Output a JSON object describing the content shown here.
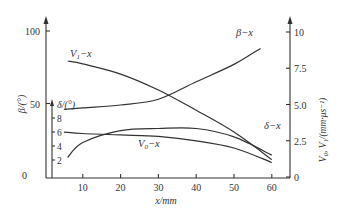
{
  "chart_data": {
    "type": "line",
    "title": "",
    "xlabel": "x/mm",
    "ylabel_left": "β/(°)",
    "ylabel_inner": "δ/(°)",
    "ylabel_right": "V0, V1/(mm·μs⁻¹)",
    "x_ticks": [
      "10",
      "20",
      "30",
      "40",
      "50",
      "60"
    ],
    "x_origin_label": "0",
    "left_ticks": [
      "100",
      "50"
    ],
    "left_origin_label": "0",
    "inner_ticks": [
      "8",
      "6",
      "4",
      "2"
    ],
    "right_ticks": [
      "10",
      "7.5",
      "5.0",
      "2.5",
      "0"
    ],
    "xlim": [
      0,
      65
    ],
    "ylim_left": [
      0,
      100
    ],
    "ylim_inner": [
      0,
      10
    ],
    "ylim_right": [
      0,
      10
    ],
    "grid": false,
    "legend": "inline labels",
    "series": [
      {
        "name": "β-x",
        "axis": "left",
        "label": "β−x",
        "x": [
          5,
          10,
          20,
          30,
          40,
          50,
          57
        ],
        "values": [
          46,
          47,
          49,
          53,
          65,
          77,
          88
        ]
      },
      {
        "name": "V1-x",
        "axis": "right",
        "label": "V₁−x",
        "x": [
          6,
          10,
          20,
          30,
          40,
          50,
          60
        ],
        "values": [
          8.0,
          7.8,
          7.1,
          6.0,
          4.6,
          3.1,
          1.2
        ]
      },
      {
        "name": "V0-x",
        "axis": "right",
        "label": "V₀−x",
        "x": [
          5,
          10,
          20,
          30,
          40,
          50,
          60
        ],
        "values": [
          3.1,
          3.0,
          2.9,
          2.8,
          2.5,
          2.0,
          1.0
        ]
      },
      {
        "name": "δ-x",
        "axis": "inner",
        "label": "δ−x",
        "x": [
          6,
          10,
          20,
          30,
          40,
          50,
          60
        ],
        "values": [
          2.4,
          4.5,
          6.2,
          6.5,
          6.5,
          5.3,
          2.7
        ]
      }
    ]
  },
  "labels": {
    "beta_curve": "β−x",
    "v1_curve_main": "V",
    "v1_curve_sub": "1",
    "v1_curve_suffix": "−x",
    "v0_curve_main": "V",
    "v0_curve_sub": "0",
    "v0_curve_suffix": "−x",
    "delta_curve": "δ−x",
    "delta_axis": "δ/(°)",
    "beta_axis": "β/(°)",
    "right_axis": "V₀, V₁/(mm·μs⁻¹)",
    "x_axis": "x/mm"
  }
}
